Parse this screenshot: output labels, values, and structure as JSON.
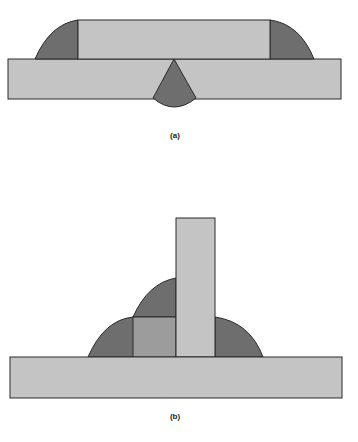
{
  "figures": [
    {
      "id": "a",
      "label": "(a)",
      "description": "Butt-lap weld: top plate on base plate with two fillet welds and a cone-shaped penetration weld"
    },
    {
      "id": "b",
      "label": "(b)",
      "description": "T-joint: vertical plate on base plate with backing block and layered fillet welds"
    }
  ],
  "colors": {
    "plate": "#c4c4c4",
    "weld": "#6e6e6e",
    "outline": "#2a2a2a",
    "background": "#ffffff"
  }
}
